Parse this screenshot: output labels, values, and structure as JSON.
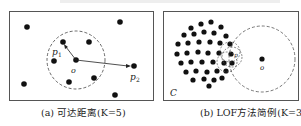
{
  "panel_a": {
    "caption": "(a) 可达距离(K=5)",
    "labels": {
      "p1": "p",
      "p1_sub": "1",
      "o": "o",
      "p2": "p",
      "p2_sub": "2"
    }
  },
  "panel_b": {
    "caption": "(b) LOF方法简例(K=3)",
    "labels": {
      "o": "o",
      "p": "p",
      "cluster": "C"
    }
  }
}
